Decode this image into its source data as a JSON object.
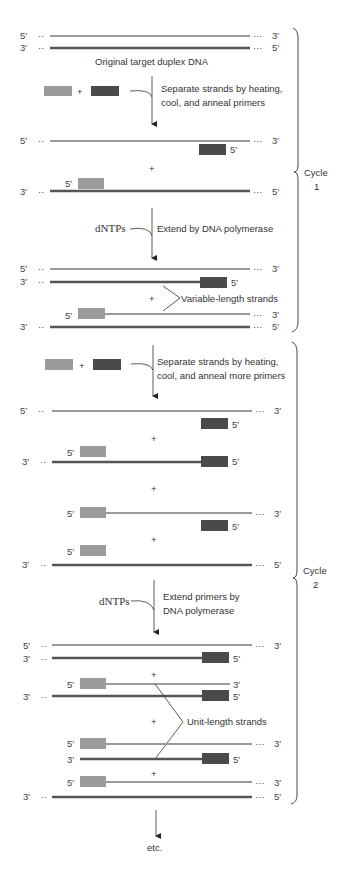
{
  "colors": {
    "template_strand": "#555555",
    "new_strand": "#9a9a9a",
    "primer_light": "#9b9b9b",
    "primer_dark": "#4a4a4a",
    "text": "#333333",
    "line": "#333333"
  },
  "labels": {
    "five_prime": "5′",
    "three_prime": "3′",
    "plus": "+",
    "original": "Original target duplex DNA",
    "step1_line1": "Separate strands by heating,",
    "step1_line2": "cool, and anneal primers",
    "dntps1": "dNTPs",
    "step2": "Extend by DNA polymerase",
    "variable": "Variable-length strands",
    "step3_line1": "Separate strands by heating,",
    "step3_line2": "cool, and anneal more primers",
    "dntps2": "dNTPs",
    "step4_line1": "Extend primers by",
    "step4_line2": "DNA polymerase",
    "unit": "Unit-length strands",
    "etc": "etc.",
    "cycle1_word": "Cycle",
    "cycle1_num": "1",
    "cycle2_word": "Cycle",
    "cycle2_num": "2"
  }
}
